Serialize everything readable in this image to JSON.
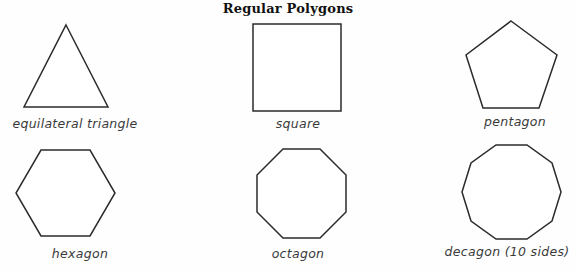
{
  "worksheet": {
    "title": "Regular Polygons",
    "background_color": "#fefefe",
    "stroke_color": "#2b2b2b",
    "title_color": "#111111",
    "caption_color": "#3a3a3a"
  },
  "figures": [
    {
      "key": "triangle",
      "caption": "equilateral triangle",
      "sides": 3,
      "points": "48,3 90,85 6,85"
    },
    {
      "key": "square",
      "caption": "square",
      "sides": 4,
      "points": "2,2 90,2 90,89 2,89"
    },
    {
      "key": "pentagon",
      "caption": "pentagon",
      "sides": 5,
      "points": "47,3 93,37 75,90 19,90 2,37"
    },
    {
      "key": "hexagon",
      "caption": "hexagon",
      "sides": 6,
      "points": "27,3 76,3 101,46 76,89 27,89 2,46"
    },
    {
      "key": "octagon",
      "caption": "octagon",
      "sides": 8,
      "points": "28,3 65,3 91,29 91,66 65,92 28,92 2,66 2,29"
    },
    {
      "key": "decagon",
      "caption": "decagon (10 sides)",
      "sides": 10,
      "points": "33,3 64,3 89,21 98,50 89,79 64,97 33,97 8,79 -1,50 8,21"
    }
  ]
}
